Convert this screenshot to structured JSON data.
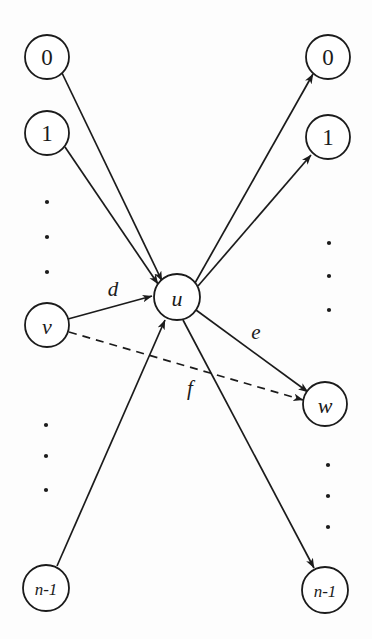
{
  "figure": {
    "background_color": "#fdfdfd",
    "stroke_color": "#1b1b1b",
    "node_fill": "#ffffff"
  },
  "nodes": {
    "center": {
      "label": "u",
      "cx": 177,
      "cy": 297,
      "r": 23,
      "italic": true
    },
    "left_column": [
      {
        "label": "0",
        "cx": 47,
        "cy": 57,
        "r": 22,
        "italic": false
      },
      {
        "label": "1",
        "cx": 47,
        "cy": 133,
        "r": 22,
        "italic": false
      },
      {
        "label": "v",
        "cx": 47,
        "cy": 325,
        "r": 22,
        "italic": true
      },
      {
        "label": "n-1",
        "cx": 46,
        "cy": 588,
        "r": 23,
        "italic": false
      }
    ],
    "right_column": [
      {
        "label": "0",
        "cx": 328,
        "cy": 57,
        "r": 22,
        "italic": false
      },
      {
        "label": "1",
        "cx": 328,
        "cy": 137,
        "r": 22,
        "italic": false
      },
      {
        "label": "w",
        "cx": 325,
        "cy": 404,
        "r": 22,
        "italic": true
      },
      {
        "label": "n-1",
        "cx": 325,
        "cy": 590,
        "r": 23,
        "italic": false
      }
    ]
  },
  "ellipsis_dots": {
    "left_upper": {
      "x": 47,
      "ys": [
        202,
        237,
        272
      ]
    },
    "left_lower": {
      "x": 46,
      "ys": [
        425,
        456,
        490
      ]
    },
    "right_upper": {
      "x": 329,
      "ys": [
        243,
        276,
        310
      ]
    },
    "right_lower": {
      "x": 328,
      "ys": [
        465,
        496,
        527
      ]
    }
  },
  "edges": [
    {
      "name": "edge-zero-to-u",
      "from": "left-0",
      "to": "u",
      "style": "solid",
      "arrow": "end",
      "label": ""
    },
    {
      "name": "edge-one-to-u",
      "from": "left-1",
      "to": "u",
      "style": "solid",
      "arrow": "end",
      "label": ""
    },
    {
      "name": "edge-v-to-u",
      "from": "v",
      "to": "u",
      "style": "solid",
      "arrow": "end",
      "label": "d"
    },
    {
      "name": "edge-nminus1-to-u",
      "from": "left-n-1",
      "to": "u",
      "style": "solid",
      "arrow": "end",
      "label": ""
    },
    {
      "name": "edge-u-to-zero",
      "from": "u",
      "to": "right-0",
      "style": "solid",
      "arrow": "end",
      "label": ""
    },
    {
      "name": "edge-u-to-one",
      "from": "u",
      "to": "right-1",
      "style": "solid",
      "arrow": "end",
      "label": ""
    },
    {
      "name": "edge-u-to-w",
      "from": "u",
      "to": "w",
      "style": "solid",
      "arrow": "end",
      "label": "e"
    },
    {
      "name": "edge-u-to-nminus1",
      "from": "u",
      "to": "right-n-1",
      "style": "solid",
      "arrow": "end",
      "label": ""
    },
    {
      "name": "edge-v-to-w-dashed",
      "from": "v",
      "to": "w",
      "style": "dashed",
      "arrow": "end",
      "label": "f"
    }
  ],
  "edge_labels": [
    {
      "text": "d",
      "x": 113,
      "y": 289
    },
    {
      "text": "e",
      "x": 256,
      "y": 332
    },
    {
      "text": "f",
      "x": 190,
      "y": 388
    }
  ]
}
